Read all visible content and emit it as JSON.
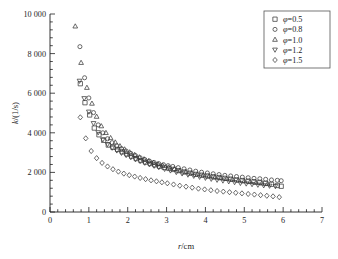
{
  "chart_data": {
    "type": "scatter",
    "title": "",
    "xlabel": "r/cm",
    "ylabel": "k/(1/s)",
    "xlim": [
      0,
      7
    ],
    "ylim": [
      0,
      10000
    ],
    "xticks": [
      "0",
      "1",
      "2",
      "3",
      "4",
      "5",
      "6",
      "7"
    ],
    "xtick_values": [
      0,
      1,
      2,
      3,
      4,
      5,
      6,
      7
    ],
    "yticks": [
      "0",
      "2 000",
      "4 000",
      "6 000",
      "8 000",
      "10 000"
    ],
    "ytick_values": [
      0,
      2000,
      4000,
      6000,
      8000,
      10000
    ],
    "grid": false,
    "legend_position": "top-right",
    "minor_ticks_per_interval": 5,
    "series": [
      {
        "name": "φ=0.5",
        "marker": "square",
        "x": [
          0.78,
          0.9,
          1.02,
          1.14,
          1.26,
          1.38,
          1.5,
          1.62,
          1.74,
          1.86,
          1.98,
          2.1,
          2.22,
          2.34,
          2.46,
          2.58,
          2.7,
          2.82,
          2.94,
          3.06,
          3.18,
          3.3,
          3.45,
          3.6,
          3.75,
          3.9,
          4.05,
          4.2,
          4.35,
          4.5,
          4.65,
          4.8,
          4.95,
          5.1,
          5.25,
          5.4,
          5.55,
          5.7,
          5.85,
          5.95
        ],
        "y": [
          6480,
          5520,
          4900,
          4240,
          3900,
          3620,
          3380,
          3270,
          3160,
          3040,
          2930,
          2820,
          2700,
          2600,
          2520,
          2450,
          2380,
          2310,
          2250,
          2200,
          2150,
          2090,
          2020,
          1960,
          1900,
          1860,
          1820,
          1780,
          1740,
          1700,
          1660,
          1620,
          1590,
          1560,
          1530,
          1500,
          1450,
          1400,
          1340,
          1300
        ]
      },
      {
        "name": "φ=0.8",
        "marker": "circle",
        "x": [
          0.77,
          0.89,
          1.0,
          1.12,
          1.24,
          1.36,
          1.48,
          1.6,
          1.72,
          1.84,
          1.96,
          2.08,
          2.2,
          2.32,
          2.44,
          2.56,
          2.68,
          2.8,
          2.92,
          3.04,
          3.16,
          3.3,
          3.45,
          3.6,
          3.75,
          3.9,
          4.05,
          4.2,
          4.35,
          4.5,
          4.65,
          4.8,
          4.95,
          5.1,
          5.25,
          5.4,
          5.55,
          5.7,
          5.85,
          5.95
        ],
        "y": [
          8350,
          6780,
          5760,
          5020,
          4400,
          4000,
          3700,
          3500,
          3340,
          3200,
          3080,
          2960,
          2850,
          2740,
          2650,
          2570,
          2500,
          2440,
          2390,
          2340,
          2300,
          2240,
          2180,
          2120,
          2060,
          2010,
          1970,
          1930,
          1890,
          1850,
          1820,
          1790,
          1760,
          1730,
          1700,
          1680,
          1650,
          1620,
          1600,
          1580
        ]
      },
      {
        "name": "φ=1.0",
        "marker": "triangle-up",
        "x": [
          0.65,
          0.8,
          0.95,
          1.08,
          1.2,
          1.32,
          1.44,
          1.56,
          1.68,
          1.8,
          1.92,
          2.05,
          2.18,
          2.3,
          2.42,
          2.54,
          2.66,
          2.78,
          2.9,
          3.05,
          3.2,
          3.35,
          3.5,
          3.65,
          3.8,
          3.95,
          4.1,
          4.25,
          4.4,
          4.55,
          4.7,
          4.85,
          5.0,
          5.15,
          5.3,
          5.45,
          5.6
        ],
        "y": [
          9380,
          7540,
          6280,
          5480,
          4820,
          4340,
          4000,
          3740,
          3520,
          3330,
          3170,
          3020,
          2890,
          2770,
          2670,
          2580,
          2500,
          2420,
          2350,
          2260,
          2180,
          2100,
          2030,
          1970,
          1910,
          1860,
          1810,
          1760,
          1720,
          1680,
          1640,
          1600,
          1560,
          1520,
          1480,
          1450,
          1420
        ]
      },
      {
        "name": "φ=1.2",
        "marker": "triangle-down",
        "x": [
          0.76,
          0.88,
          1.0,
          1.12,
          1.24,
          1.36,
          1.48,
          1.6,
          1.72,
          1.84,
          1.96,
          2.08,
          2.2,
          2.32,
          2.44,
          2.56,
          2.68,
          2.8,
          2.95,
          3.1,
          3.25,
          3.4,
          3.55,
          3.7,
          3.85,
          4.0,
          4.15,
          4.3,
          4.45,
          4.6,
          4.75,
          4.9,
          5.05,
          5.2,
          5.35,
          5.5,
          5.65,
          5.8
        ],
        "y": [
          6620,
          5740,
          5060,
          4480,
          4020,
          3660,
          3420,
          3240,
          3100,
          2980,
          2870,
          2760,
          2660,
          2570,
          2480,
          2400,
          2330,
          2260,
          2170,
          2090,
          2010,
          1940,
          1880,
          1820,
          1770,
          1720,
          1670,
          1620,
          1580,
          1540,
          1500,
          1460,
          1430,
          1400,
          1370,
          1340,
          1320,
          1300
        ]
      },
      {
        "name": "φ=1.5",
        "marker": "diamond",
        "x": [
          0.78,
          0.92,
          1.06,
          1.2,
          1.34,
          1.48,
          1.62,
          1.76,
          1.9,
          2.04,
          2.18,
          2.32,
          2.46,
          2.6,
          2.74,
          2.88,
          3.02,
          3.18,
          3.34,
          3.5,
          3.66,
          3.82,
          3.98,
          4.14,
          4.3,
          4.46,
          4.62,
          4.78,
          4.94,
          5.1,
          5.26,
          5.42,
          5.58,
          5.74,
          5.9
        ],
        "y": [
          4780,
          3720,
          3080,
          2720,
          2480,
          2300,
          2160,
          2040,
          1940,
          1860,
          1790,
          1720,
          1660,
          1600,
          1550,
          1500,
          1450,
          1390,
          1330,
          1280,
          1230,
          1180,
          1140,
          1100,
          1060,
          1030,
          1000,
          970,
          940,
          910,
          880,
          850,
          820,
          790,
          750
        ]
      }
    ]
  },
  "legend": {
    "entries": [
      {
        "label": "φ=0.5",
        "marker": "square"
      },
      {
        "label": "φ=0.8",
        "marker": "circle"
      },
      {
        "label": "φ=1.0",
        "marker": "triangle-up"
      },
      {
        "label": "φ=1.2",
        "marker": "triangle-down"
      },
      {
        "label": "φ=1.5",
        "marker": "diamond"
      }
    ]
  },
  "caption": {
    "partial_text": ""
  }
}
